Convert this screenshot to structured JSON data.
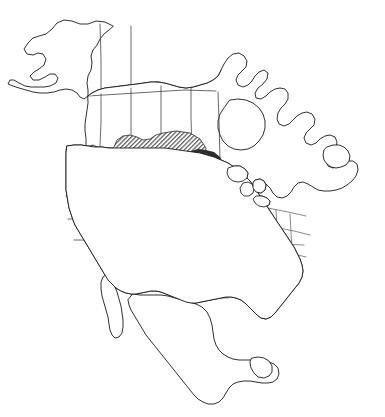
{
  "figure": {
    "kind": "distribution-range-map",
    "region": "North America",
    "background_color": "#ffffff",
    "line_color": "#1a1a1a",
    "has_title": false,
    "has_legend": false,
    "has_axis": false,
    "has_scale_bar": false,
    "has_text_labels": false,
    "caption": ""
  },
  "landmasses": [
    {
      "name": "alaska",
      "label": "Alaska",
      "shaded": false
    },
    {
      "name": "canada",
      "label": "Canada",
      "shaded": true
    },
    {
      "name": "united-states",
      "label": "United States",
      "shaded": true
    },
    {
      "name": "mexico",
      "label": "Mexico",
      "shaded": false
    },
    {
      "name": "newfoundland",
      "label": "Newfoundland",
      "shaded": false
    },
    {
      "name": "baja-california",
      "label": "Baja California",
      "shaded": false
    },
    {
      "name": "yucatan",
      "label": "Yucatan Peninsula",
      "shaded": false
    },
    {
      "name": "florida-peninsula",
      "label": "Florida Peninsula",
      "shaded": false
    }
  ],
  "water_bodies": [
    {
      "name": "great-lakes",
      "label": "Great Lakes"
    },
    {
      "name": "hudson-bay",
      "label": "Hudson Bay"
    },
    {
      "name": "gulf-of-mexico",
      "label": "Gulf of Mexico"
    }
  ],
  "range_zones": [
    {
      "name": "zone-diagonal-hatch",
      "label": "Diagonal hatched range",
      "pattern": "diagonal-hatch",
      "hatch_angle_deg": 45,
      "hatch_spacing_px": 2.1,
      "fill_color": "#5a5a5a",
      "tone": "medium",
      "extent": "Great Plains, Intermountain West and Canadian prairies",
      "approx_area_share_pct": 42
    },
    {
      "name": "zone-solid-dark",
      "label": "Solid dark range",
      "pattern": "solid",
      "fill_color": "#2e2e2e",
      "tone": "dark",
      "extent": "Central Mississippi Valley, eastern Plains and eastern Texas",
      "approx_area_share_pct": 40
    },
    {
      "name": "zone-horizontal-hatch",
      "label": "Horizontal line range",
      "pattern": "horizontal-lines",
      "hatch_spacing_px": 3.0,
      "fill_color": "#1f1f1f",
      "tone": "dark-lines",
      "extent": "Gulf Coast: Mississippi, Alabama and Florida panhandle",
      "approx_area_share_pct": 18
    }
  ],
  "internal_boundaries": {
    "name": "state-province-borders",
    "label": "State and provincial boundaries",
    "visible": true,
    "stroke_color": "#3a3a3a"
  },
  "chart_data": {
    "type": "map",
    "title": "",
    "xlabel": "",
    "ylabel": "",
    "projection": "unspecified-conic",
    "categories": [
      "Diagonal hatched range",
      "Solid dark range",
      "Horizontal line range"
    ],
    "values": [
      42,
      40,
      18
    ],
    "series": [
      {
        "name": "Range extent (approx. share of shaded area, %)",
        "values": [
          42,
          40,
          18
        ]
      }
    ],
    "legend_position": "none",
    "grid": false,
    "annotations": []
  }
}
